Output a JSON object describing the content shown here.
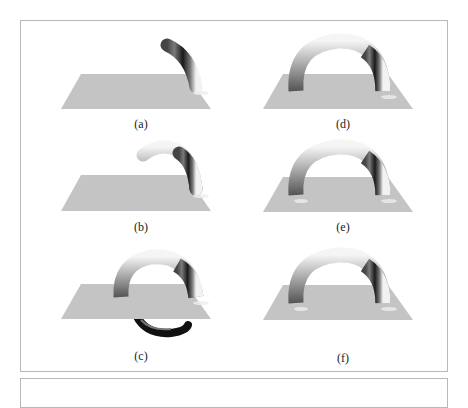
{
  "figure": {
    "panels": [
      {
        "id": "a",
        "label": "(a)",
        "stage": "partial-arc-short"
      },
      {
        "id": "b",
        "label": "(b)",
        "stage": "partial-arc-long"
      },
      {
        "id": "c",
        "label": "(c)",
        "stage": "full-loop-with-submerged-segment"
      },
      {
        "id": "d",
        "label": "(d)",
        "stage": "full-arch"
      },
      {
        "id": "e",
        "label": "(e)",
        "stage": "full-arch"
      },
      {
        "id": "f",
        "label": "(f)",
        "stage": "full-arch"
      }
    ],
    "colors": {
      "plane": "#c4c4c4",
      "tube_light": "#f4f4f4",
      "tube_mid": "#8a8a8a",
      "tube_dark": "#111111",
      "frame_border": "#b8b8b8"
    }
  }
}
